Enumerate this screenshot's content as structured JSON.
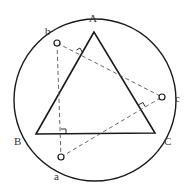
{
  "diagram": {
    "title": "",
    "colors": {
      "stroke": "#1a1a1a",
      "dashed": "#555555",
      "label": "#333333",
      "background": "#ffffff"
    },
    "circle": {
      "cx": 95,
      "cy": 100,
      "r": 81
    },
    "triangle": {
      "vertices": {
        "A": {
          "x": 94,
          "y": 32
        },
        "B": {
          "x": 36,
          "y": 134
        },
        "C": {
          "x": 155,
          "y": 133
        }
      }
    },
    "points": {
      "a": {
        "x": 61,
        "y": 157
      },
      "b": {
        "x": 57,
        "y": 43
      },
      "c": {
        "x": 162,
        "y": 97
      }
    },
    "labels": {
      "A": "A",
      "B": "B",
      "C": "C",
      "a": "a",
      "b": "b",
      "c": "c"
    },
    "right_angle_marks": [
      {
        "near": "side AB",
        "from_point": "b"
      },
      {
        "near": "side BC",
        "from_point": "a"
      },
      {
        "near": "side AC",
        "from_point": "c"
      }
    ]
  }
}
